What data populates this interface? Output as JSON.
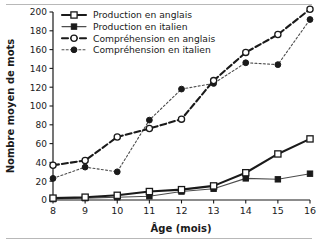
{
  "chart_data": {
    "type": "line",
    "title": "",
    "xlabel": "Âge (mois)",
    "ylabel": "Nombre moyen de mots",
    "x": [
      8,
      9,
      10,
      11,
      12,
      13,
      14,
      15,
      16
    ],
    "xlim": [
      8,
      16
    ],
    "ylim": [
      0,
      200
    ],
    "xticks": [
      "8",
      "9",
      "10",
      "11",
      "12",
      "13",
      "14",
      "15",
      "16"
    ],
    "yticks": [
      "0",
      "20",
      "40",
      "60",
      "80",
      "100",
      "120",
      "140",
      "160",
      "180",
      "200"
    ],
    "grid": false,
    "legend_position": "top-left",
    "series": [
      {
        "name": "Production en anglais",
        "values": [
          2,
          3,
          5,
          9,
          11,
          15,
          29,
          49,
          65
        ],
        "marker": "open-square",
        "line_style": "solid",
        "line_width": "thick",
        "color": "#1a1a1a"
      },
      {
        "name": "Production en italien",
        "values": [
          1,
          2,
          3,
          4,
          9,
          12,
          23,
          22,
          28
        ],
        "marker": "filled-square",
        "line_style": "solid",
        "line_width": "thin",
        "color": "#4d4d4d"
      },
      {
        "name": "Compréhension en anglais",
        "values": [
          37,
          42,
          67,
          76,
          86,
          127,
          157,
          176,
          203
        ],
        "marker": "open-circle",
        "line_style": "dashed",
        "line_width": "thick",
        "color": "#1a1a1a"
      },
      {
        "name": "Compréhension en italien",
        "values": [
          23,
          35,
          30,
          85,
          118,
          124,
          146,
          144,
          192
        ],
        "marker": "filled-circle",
        "line_style": "dotted",
        "line_width": "thin",
        "color": "#4d4d4d"
      }
    ]
  },
  "legend": {
    "items": [
      {
        "label": "Production en anglais"
      },
      {
        "label": "Production en italien"
      },
      {
        "label": "Compréhension en anglais"
      },
      {
        "label": "Compréhension en italien"
      }
    ]
  }
}
